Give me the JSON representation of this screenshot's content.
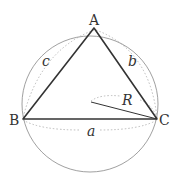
{
  "diagram": {
    "vertices": {
      "A": {
        "label": "A",
        "x": 94,
        "y": 28
      },
      "B": {
        "label": "B",
        "x": 23,
        "y": 119
      },
      "C": {
        "label": "C",
        "x": 157,
        "y": 119
      }
    },
    "sides": {
      "a": {
        "label": "a",
        "from": "B",
        "to": "C"
      },
      "b": {
        "label": "b",
        "from": "A",
        "to": "C"
      },
      "c": {
        "label": "c",
        "from": "A",
        "to": "B"
      }
    },
    "circle": {
      "cx": 90,
      "cy": 104,
      "r": 68
    },
    "radius": {
      "label": "R",
      "from": [
        91,
        102
      ],
      "to": [
        157,
        119
      ]
    },
    "colors": {
      "stroke": "#333333",
      "circle": "#777777",
      "dotted": "#aaaaaa"
    }
  }
}
